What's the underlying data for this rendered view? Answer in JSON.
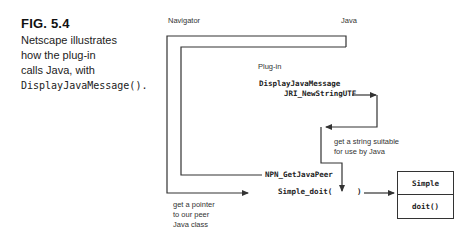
{
  "figure": {
    "number": "FIG. 5.4",
    "caption_lines": [
      "Netscape illustrates",
      "how the plug-in",
      "calls Java, with"
    ],
    "caption_code": "DisplayJavaMessage()."
  },
  "labels": {
    "navigator": "Navigator",
    "java": "Java",
    "plugin": "Plug-in"
  },
  "code_labels": {
    "display_java_message": "DisplayJavaMessage",
    "jri_new_string_utf": "JRI_NewStringUTF",
    "npn_get_java_peer": "NPN_GetJavaPeer",
    "simple_doit_open": "Simple_doit(",
    "simple_doit_close": ")"
  },
  "notes": {
    "string_note": [
      "get a string suitable",
      "for use by Java"
    ],
    "pointer_note": [
      "get a pointer",
      "to our peer",
      "Java class"
    ]
  },
  "class_box": {
    "name": "Simple",
    "method": "doit()"
  },
  "colors": {
    "line": "#333333",
    "text": "#222222",
    "background": "#ffffff"
  }
}
